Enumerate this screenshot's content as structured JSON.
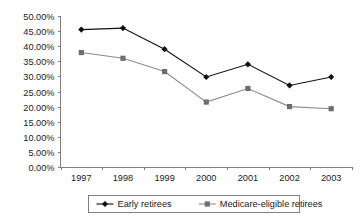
{
  "chart_data": {
    "type": "line",
    "title": "",
    "xlabel": "",
    "ylabel": "",
    "categories": [
      "1997",
      "1998",
      "1999",
      "2000",
      "2001",
      "2002",
      "2003"
    ],
    "series": [
      {
        "name": "Early retirees",
        "marker": "diamond",
        "color": "#101010",
        "values": [
          45.5,
          46.0,
          39.0,
          29.8,
          34.0,
          27.0,
          29.8
        ]
      },
      {
        "name": "Medicare-eligible retirees",
        "marker": "square",
        "color": "#6e6e6e",
        "values": [
          37.9,
          36.0,
          31.6,
          21.5,
          26.0,
          20.0,
          19.3
        ]
      }
    ],
    "ylim": [
      0,
      50
    ],
    "ytick_step": 5,
    "ytick_labels": [
      "0.00%",
      "5.00%",
      "10.00%",
      "15.00%",
      "20.00%",
      "25.00%",
      "30.00%",
      "35.00%",
      "40.00%",
      "45.00%",
      "50.00%"
    ],
    "grid": false,
    "legend_position": "bottom"
  },
  "legend": {
    "entries": [
      {
        "label": "Early retirees"
      },
      {
        "label": "Medicare-eligible retirees"
      }
    ]
  },
  "colors": {
    "series_early": "#101010",
    "series_medicare": "#6e6e6e",
    "axis": "#808080",
    "background": "#ffffff"
  }
}
